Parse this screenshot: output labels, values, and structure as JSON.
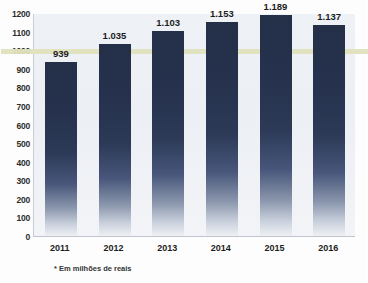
{
  "chart_data": {
    "type": "bar",
    "title": "",
    "subtitle": "",
    "xlabel": "",
    "ylabel": "",
    "categories": [
      "2011",
      "2012",
      "2013",
      "2014",
      "2015",
      "2016"
    ],
    "values": [
      939,
      1035,
      1103,
      1153,
      1189,
      1137
    ],
    "value_labels": [
      "939",
      "1.035",
      "1.103",
      "1.153",
      "1.189",
      "1.137"
    ],
    "ylim": [
      0,
      1200
    ],
    "ytick_labels": [
      "1200",
      "1100",
      "1000",
      "900",
      "800",
      "700",
      "600",
      "500",
      "400",
      "300",
      "200",
      "100",
      "0"
    ],
    "ytick_values": [
      1200,
      1100,
      1000,
      900,
      800,
      700,
      600,
      500,
      400,
      300,
      200,
      100,
      0
    ],
    "grid": false,
    "legend": null,
    "annotations": [
      {
        "name": "reference-line",
        "value": 1000,
        "color": "#dfe0bd"
      }
    ],
    "footnote": "* Em milhões de reais",
    "colors": {
      "bar_top": "#242f48",
      "bar_bottom": "#eef0f4",
      "plot_background": "#eef1f5",
      "reference_line": "#dfe0bd",
      "axis_text": "#1d1d1d"
    }
  }
}
